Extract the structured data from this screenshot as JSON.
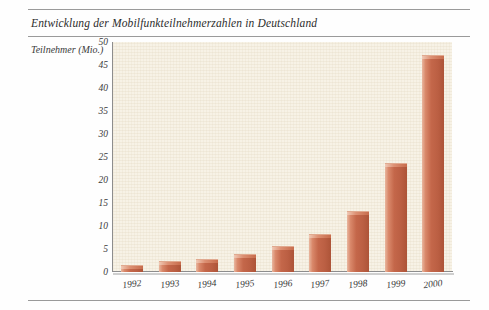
{
  "figure": {
    "title": "Entwicklung der Mobilfunkteilnehmerzahlen in Deutschland",
    "y_axis_caption": "Teilnehmer (Mio.)"
  },
  "colors": {
    "bar_fill": "#c4674a",
    "bar_highlight": "#e9b79f",
    "bar_shadow": "#ad5438",
    "panel_background": "#f7f2e6",
    "axis_line": "#8d8d8d",
    "rule": "#9a9a9a",
    "text": "#2c2c2c"
  },
  "chart_data": {
    "type": "bar",
    "title": "Entwicklung der Mobilfunkteilnehmerzahlen in Deutschland",
    "xlabel": "",
    "ylabel": "Teilnehmer (Mio.)",
    "ylim": [
      0,
      50
    ],
    "yticks": [
      0,
      5,
      10,
      15,
      20,
      25,
      30,
      35,
      40,
      45,
      50
    ],
    "ytick_labels": [
      "0",
      "5",
      "10",
      "15",
      "20",
      "25",
      "30",
      "35",
      "40",
      "45",
      "50"
    ],
    "grid": false,
    "legend": null,
    "categories": [
      "1992",
      "1993",
      "1994",
      "1995",
      "1996",
      "1997",
      "1998",
      "1999",
      "2000"
    ],
    "values": [
      1.4,
      2.2,
      2.6,
      3.8,
      5.5,
      8.0,
      13.0,
      23.5,
      47.0
    ],
    "series": [
      {
        "name": "Teilnehmer (Mio.)",
        "values": [
          1.4,
          2.2,
          2.6,
          3.8,
          5.5,
          8.0,
          13.0,
          23.5,
          47.0
        ]
      }
    ]
  }
}
